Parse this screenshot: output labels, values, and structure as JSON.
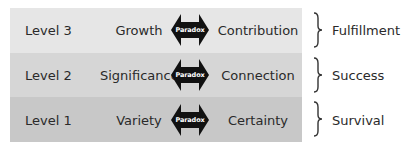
{
  "rows": [
    {
      "level": "Level 3",
      "left_need": "Growth",
      "paradox_label": "Paradox",
      "right_need": "Contribution",
      "outcome": "Fulfillment",
      "background": "#e6e6e6"
    },
    {
      "level": "Level 2",
      "left_need": "Significance",
      "paradox_label": "Paradox",
      "right_need": "Connection",
      "outcome": "Success",
      "background": "#d6d6d6"
    },
    {
      "level": "Level 1",
      "left_need": "Variety",
      "paradox_label": "Paradox",
      "right_need": "Certainty",
      "outcome": "Survival",
      "background": "#c8c8c8"
    }
  ],
  "colors": {
    "arrow": "#111111",
    "text": "#2a2a2a",
    "arrow_text": "#ffffff"
  },
  "icons": {
    "paradox_arrow": "double-headed-arrow-icon",
    "bracket": "right-curly-brace-icon"
  }
}
